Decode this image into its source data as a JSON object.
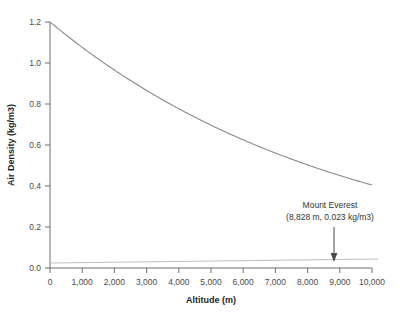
{
  "chart_data": {
    "type": "line",
    "title": "",
    "xlabel": "Altitude (m)",
    "ylabel": "Air Density (kg/m3)",
    "xlim": [
      0,
      10000
    ],
    "ylim": [
      0,
      1.2
    ],
    "grid": false,
    "legend": false,
    "xticks": [
      0,
      1000,
      2000,
      3000,
      4000,
      5000,
      6000,
      7000,
      8000,
      9000,
      10000
    ],
    "xtick_labels": [
      "0",
      "1,000",
      "2,000",
      "3,000",
      "4,000",
      "5,000",
      "6,000",
      "7,000",
      "8,000",
      "9,000",
      "10,000"
    ],
    "yticks": [
      0.0,
      0.2,
      0.4,
      0.6,
      0.8,
      1.0,
      1.2
    ],
    "ytick_labels": [
      "0.0",
      "0.2",
      "0.4",
      "0.6",
      "0.8",
      "1.0",
      "1.2"
    ],
    "series": [
      {
        "name": "Air density vs altitude",
        "x": [
          0,
          500,
          1000,
          1500,
          2000,
          2500,
          3000,
          3500,
          4000,
          4500,
          5000,
          5500,
          6000,
          6500,
          7000,
          7500,
          8000,
          8500,
          8828,
          9000,
          9500,
          10000
        ],
        "values": [
          1.2,
          1.09,
          1.0,
          0.91,
          0.82,
          0.74,
          0.67,
          0.6,
          0.53,
          0.47,
          0.41,
          0.36,
          0.31,
          0.26,
          0.22,
          0.18,
          0.14,
          0.11,
          0.023,
          0.08,
          0.05,
          0.03
        ]
      }
    ],
    "annotations": [
      {
        "name": "mount-everest",
        "line1": "Mount Everest",
        "line2": "(8,828 m, 0.023 kg/m3)",
        "x": 8828,
        "y": 0.023,
        "arrow": "down"
      }
    ]
  }
}
